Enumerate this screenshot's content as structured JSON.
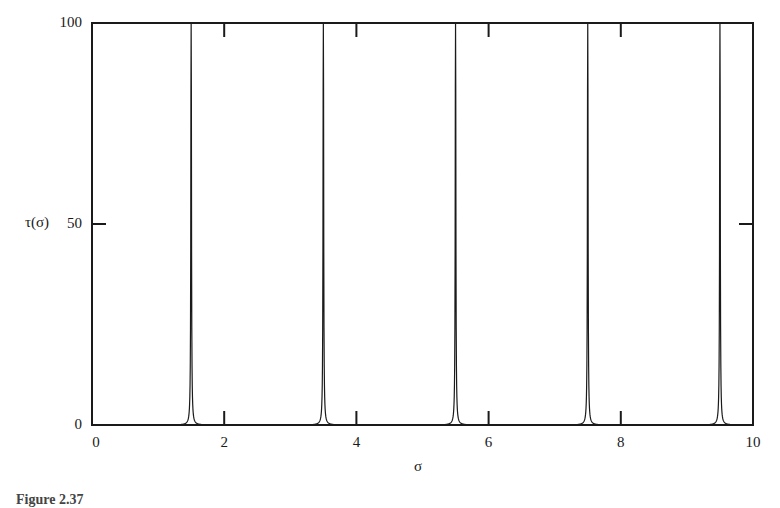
{
  "figure": {
    "caption": "Figure 2.37"
  },
  "chart_data": {
    "type": "line",
    "title": "",
    "xlabel": "σ",
    "ylabel": "τ(σ)",
    "xlim": [
      0,
      10
    ],
    "ylim": [
      0,
      100
    ],
    "x_ticks": [
      0,
      2,
      4,
      6,
      8,
      10
    ],
    "y_ticks": [
      0,
      50,
      100
    ],
    "grid": false,
    "legend": null,
    "series": [
      {
        "name": "τ(σ)",
        "description": "Periodic sharp resonance peaks (Lorentzian-like), clipped at y=100",
        "peak_positions": [
          1.5,
          3.5,
          5.5,
          7.5,
          9.5
        ],
        "peak_values": [
          100,
          100,
          100,
          100,
          100
        ],
        "baseline": 0,
        "approx_half_width": 0.05,
        "x": [
          0,
          0.5,
          1.0,
          1.2,
          1.4,
          1.45,
          1.5,
          1.55,
          1.6,
          1.8,
          2.0,
          2.5,
          3.0,
          3.2,
          3.4,
          3.45,
          3.5,
          3.55,
          3.6,
          3.8,
          4.0,
          4.5,
          5.0,
          5.2,
          5.4,
          5.45,
          5.5,
          5.55,
          5.6,
          5.8,
          6.0,
          6.5,
          7.0,
          7.2,
          7.4,
          7.45,
          7.5,
          7.55,
          7.6,
          7.8,
          8.0,
          8.5,
          9.0,
          9.2,
          9.4,
          9.45,
          9.5,
          9.55,
          9.6,
          9.8,
          10.0
        ],
        "y": [
          0,
          0.3,
          1,
          3,
          20,
          50,
          100,
          50,
          20,
          3,
          1,
          0.3,
          1,
          3,
          20,
          50,
          100,
          50,
          20,
          3,
          1,
          0.3,
          1,
          3,
          20,
          50,
          100,
          50,
          20,
          3,
          1,
          0.3,
          1,
          3,
          20,
          50,
          100,
          50,
          20,
          3,
          1,
          0.3,
          1,
          3,
          20,
          50,
          100,
          50,
          20,
          3,
          1
        ]
      }
    ]
  },
  "axes": {
    "x_tick_labels": [
      "0",
      "2",
      "4",
      "6",
      "8",
      "10"
    ],
    "y_tick_labels": [
      "0",
      "50",
      "100"
    ],
    "x_label": "σ",
    "y_label": "τ(σ)"
  },
  "colors": {
    "line": "#1a1a1a",
    "axis": "#1a1a1a",
    "background": "#ffffff"
  }
}
